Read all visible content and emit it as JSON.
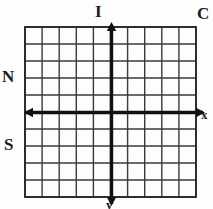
{
  "figure": {
    "width": 213,
    "height": 209,
    "background_color": "#fdfdfc",
    "ink_color": "#1a1a1a",
    "grid_line_color": "#3a3a3a"
  },
  "grid": {
    "columns": 10,
    "rows": 10,
    "left": 25,
    "top": 27,
    "right": 196,
    "bottom": 197,
    "cell_width": 17.1,
    "cell_height": 17.0,
    "thin_line_width": 1.4,
    "border_line_width": 1.8
  },
  "axes": {
    "origin_x": 111.5,
    "origin_y": 112.5,
    "line_width": 3.2,
    "x_axis": {
      "label": "x",
      "from_x": 25,
      "to_x": 205,
      "arrow_right": true,
      "arrow_left": true
    },
    "y_axis": {
      "label": "y",
      "from_y": 205,
      "to_y": 23,
      "arrow_up": true,
      "arrow_down": true
    }
  },
  "labels": {
    "quadrant_top": "I",
    "quadrant_top_right": "C",
    "quadrant_left_upper": "N",
    "quadrant_left_lower": "S",
    "axis_x": "x",
    "axis_y": "y"
  }
}
